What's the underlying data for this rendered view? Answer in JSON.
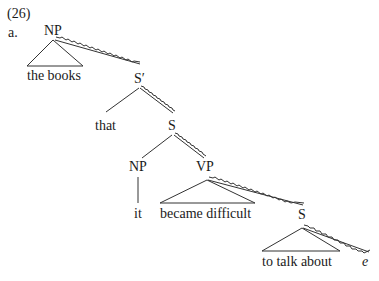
{
  "example": {
    "number": "(26)",
    "sub": "a."
  },
  "nodes": {
    "np_top": "NP",
    "the_books": "the books",
    "s_bar": "S′",
    "that": "that",
    "s_mid": "S",
    "np_low": "NP",
    "it": "it",
    "vp": "VP",
    "became_difficult": "became difficult",
    "s_low": "S",
    "to_talk_about": "to talk about",
    "gap": "e"
  },
  "style": {
    "line_color": "#333333",
    "text_color": "#1a1a1a"
  }
}
